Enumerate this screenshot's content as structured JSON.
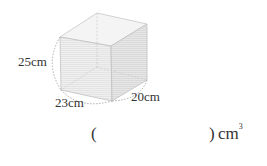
{
  "figure": {
    "shape": "rectangular-prism",
    "dimensions": {
      "height": "25cm",
      "width": "23cm",
      "depth": "20cm"
    }
  },
  "answer": {
    "open_paren": "(",
    "close_paren": ")",
    "unit": "cm",
    "exponent": "3"
  }
}
